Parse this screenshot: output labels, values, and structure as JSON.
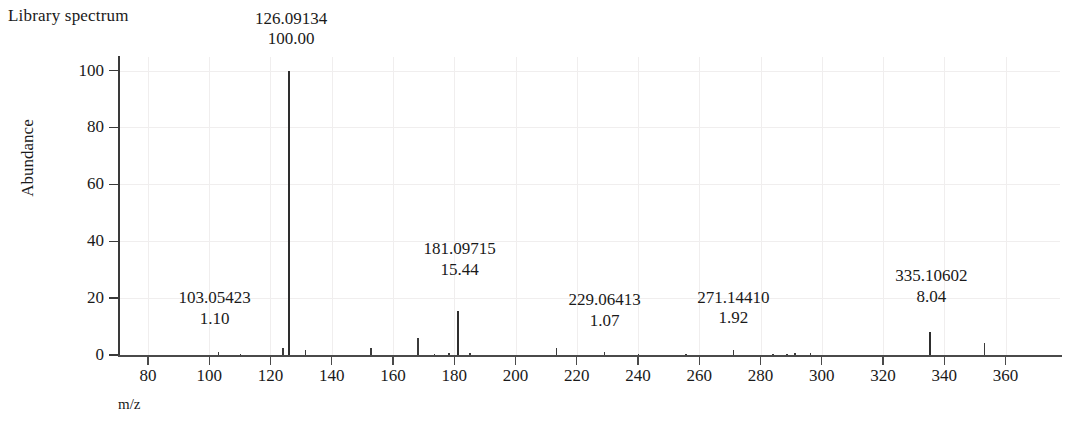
{
  "header": {
    "title": "Library spectrum"
  },
  "axes": {
    "y_title": "Abundance",
    "x_title": "m/z",
    "y_ticks": [
      "0",
      "20",
      "40",
      "60",
      "80",
      "100"
    ],
    "x_ticks": [
      "80",
      "100",
      "120",
      "140",
      "160",
      "180",
      "200",
      "220",
      "240",
      "260",
      "280",
      "300",
      "320",
      "340",
      "360"
    ]
  },
  "annotations": [
    {
      "mz": "103.05423",
      "abundance": "1.10"
    },
    {
      "mz": "126.09134",
      "abundance": "100.00"
    },
    {
      "mz": "181.09715",
      "abundance": "15.44"
    },
    {
      "mz": "229.06413",
      "abundance": "1.07"
    },
    {
      "mz": "271.14410",
      "abundance": "1.92"
    },
    {
      "mz": "335.10602",
      "abundance": "8.04"
    }
  ],
  "colors": {
    "peak": "#3b3b3b",
    "axis": "#3a3a3a",
    "grid": "#f0eeee",
    "text": "#1a1a1a"
  },
  "chart_data": {
    "type": "bar",
    "title": "Library spectrum",
    "xlabel": "m/z",
    "ylabel": "Abundance",
    "xlim": [
      70,
      372
    ],
    "ylim": [
      0,
      103
    ],
    "grid": true,
    "legend": "none",
    "x": [
      103.05423,
      110.2,
      124.1,
      126.09134,
      131.4,
      152.8,
      168.2,
      173.5,
      178.3,
      181.09715,
      185.1,
      213.4,
      229.06413,
      240.2,
      255.6,
      271.1441,
      284.1,
      288.6,
      291.2,
      296.3,
      335.10602,
      353.2
    ],
    "values": [
      1.1,
      0.4,
      2.6,
      100.0,
      1.9,
      2.5,
      6.1,
      0.5,
      0.6,
      15.44,
      0.8,
      2.5,
      1.07,
      0.4,
      0.4,
      1.92,
      0.5,
      0.5,
      0.7,
      0.8,
      8.04,
      4.2
    ],
    "labeled_peaks": [
      {
        "mz": 103.05423,
        "abundance": 1.1
      },
      {
        "mz": 126.09134,
        "abundance": 100.0
      },
      {
        "mz": 181.09715,
        "abundance": 15.44
      },
      {
        "mz": 229.06413,
        "abundance": 1.07
      },
      {
        "mz": 271.1441,
        "abundance": 1.92
      },
      {
        "mz": 335.10602,
        "abundance": 8.04
      }
    ]
  }
}
